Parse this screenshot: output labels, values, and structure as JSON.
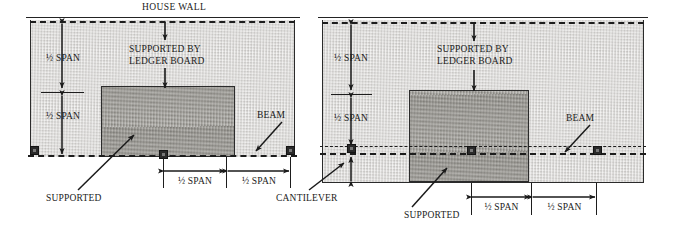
{
  "title": "HOUSE WALL",
  "labels": {
    "half_span": "½ SPAN",
    "supported_by_ledger_1": "SUPPORTED BY",
    "supported_by_ledger_2": "LEDGER BOARD",
    "beam": "BEAM",
    "supported": "SUPPORTED",
    "cantilever": "CANTILEVER"
  },
  "left_panel": {
    "vertical_dims": [
      "½ SPAN",
      "½ SPAN"
    ],
    "horizontal_dims": [
      "½ SPAN",
      "½ SPAN"
    ],
    "ledger_note_line1": "SUPPORTED BY",
    "ledger_note_line2": "LEDGER BOARD",
    "beam_label": "BEAM",
    "supported_label": "SUPPORTED",
    "cantilever_label": "CANTILEVER"
  },
  "right_panel": {
    "vertical_dims": [
      "½ SPAN",
      "½ SPAN"
    ],
    "horizontal_dims": [
      "½ SPAN",
      "½ SPAN"
    ],
    "ledger_note_line1": "SUPPORTED BY",
    "ledger_note_line2": "LEDGER BOARD",
    "beam_label": "BEAM",
    "supported_label": "SUPPORTED"
  },
  "colors": {
    "field_gray": "#d6d4d1",
    "deck_gray": "#9a9892",
    "ink": "#1a1a1a",
    "post": "#2a2a2a",
    "background": "#ffffff"
  }
}
